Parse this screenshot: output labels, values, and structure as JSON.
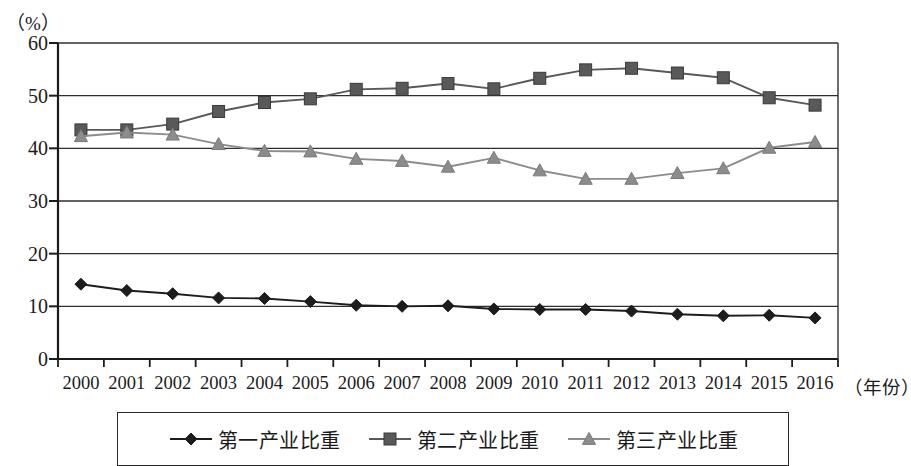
{
  "chart_data": {
    "type": "line",
    "title": "",
    "subtitle": "",
    "unit_label": "（%）",
    "ylabel": "",
    "xlabel": "（年份）",
    "ylim": [
      0,
      60
    ],
    "ytick_labels": [
      "0",
      "10",
      "20",
      "30",
      "40",
      "50",
      "60"
    ],
    "ytick_values": [
      0,
      10,
      20,
      30,
      40,
      50,
      60
    ],
    "grid": true,
    "grid_axis": "y",
    "legend_position": "bottom",
    "categories": [
      "2000",
      "2001",
      "2002",
      "2003",
      "2004",
      "2005",
      "2006",
      "2007",
      "2008",
      "2009",
      "2010",
      "2011",
      "2012",
      "2013",
      "2014",
      "2015",
      "2016"
    ],
    "series": [
      {
        "name": "第一产业比重",
        "marker": "diamond",
        "color": "#1c1c1c",
        "values": [
          14.2,
          13.0,
          12.4,
          11.6,
          11.5,
          10.9,
          10.2,
          10.0,
          10.1,
          9.5,
          9.4,
          9.4,
          9.1,
          8.5,
          8.2,
          8.3,
          7.8
        ]
      },
      {
        "name": "第二产业比重",
        "marker": "square",
        "color": "#595959",
        "values": [
          43.5,
          43.5,
          44.6,
          47.0,
          48.7,
          49.4,
          51.2,
          51.4,
          52.3,
          51.3,
          53.3,
          54.9,
          55.2,
          54.3,
          53.4,
          49.6,
          48.2
        ]
      },
      {
        "name": "第三产业比重",
        "marker": "triangle",
        "color": "#8c8c8c",
        "values": [
          42.3,
          43.0,
          42.6,
          40.8,
          39.5,
          39.4,
          38.0,
          37.6,
          36.5,
          38.2,
          35.8,
          34.2,
          34.2,
          35.3,
          36.2,
          40.1,
          41.2
        ]
      }
    ]
  },
  "axis": {
    "unit": "（%）",
    "x_title": "（年份）"
  },
  "legend": {
    "items": [
      {
        "label": "第一产业比重",
        "marker": "diamond-marker",
        "color": "#1c1c1c"
      },
      {
        "label": "第二产业比重",
        "marker": "square-marker",
        "color": "#595959"
      },
      {
        "label": "第三产业比重",
        "marker": "triangle-marker",
        "color": "#8c8c8c"
      }
    ]
  }
}
